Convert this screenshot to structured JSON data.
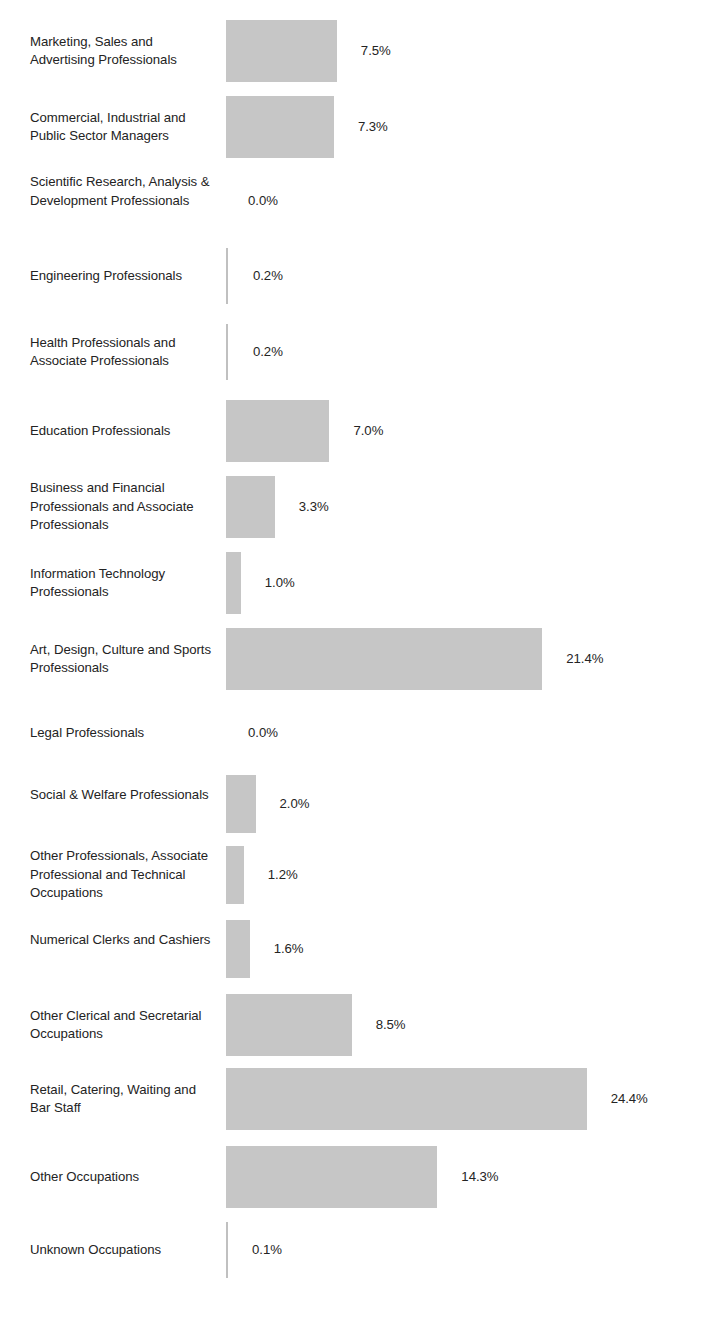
{
  "chart_data": {
    "type": "bar",
    "orientation": "horizontal",
    "title": "",
    "subtitle": "",
    "xlabel": "",
    "ylabel": "",
    "grid": false,
    "legend": "none",
    "axis_visible": false,
    "value_suffix": "%",
    "xlim": [
      0,
      24.4
    ],
    "categories": [
      "Marketing, Sales and Advertising Professionals",
      "Commercial, Industrial and Public Sector Managers",
      "Scientific Research, Analysis & Development Professionals",
      "Engineering Professionals",
      "Health Professionals and Associate Professionals",
      "Education Professionals",
      "Business and Financial Professionals and Associate Professionals",
      "Information Technology Professionals",
      "Art, Design, Culture and Sports Professionals",
      "Legal Professionals",
      "Social & Welfare Professionals",
      "Other Professionals, Associate Professional and Technical Occupations",
      "Numerical Clerks and Cashiers",
      "Other Clerical and Secretarial Occupations",
      "Retail, Catering, Waiting and Bar Staff",
      "Other Occupations",
      "Unknown Occupations"
    ],
    "values": [
      7.5,
      7.3,
      0.0,
      0.2,
      0.2,
      7.0,
      3.3,
      1.0,
      21.4,
      0.0,
      2.0,
      1.2,
      1.6,
      8.5,
      24.4,
      14.3,
      0.1
    ],
    "value_labels": [
      "7.5%",
      "7.3%",
      "0.0%",
      "0.2%",
      "0.2%",
      "7.0%",
      "3.3%",
      "1.0%",
      "21.4%",
      "0.0%",
      "2.0%",
      "1.2%",
      "1.6%",
      "8.5%",
      "24.4%",
      "14.3%",
      "0.1%"
    ],
    "bar_color": "#c6c6c6",
    "text_color": "#232323",
    "background_color": "#ffffff"
  },
  "rows": [
    {
      "label": "Marketing, Sales and Advertising Professionals",
      "value": "7.5%",
      "num": 7.5,
      "lines": 2
    },
    {
      "label": "Commercial, Industrial and Public Sector Managers",
      "value": "7.3%",
      "num": 7.3,
      "lines": 2
    },
    {
      "label": "Scientific Research, Analysis & Development Professionals",
      "value": "0.0%",
      "num": 0.0,
      "lines": 3
    },
    {
      "label": "Engineering Professionals",
      "value": "0.2%",
      "num": 0.2,
      "lines": 1
    },
    {
      "label": "Health Professionals and Associate Professionals",
      "value": "0.2%",
      "num": 0.2,
      "lines": 2
    },
    {
      "label": "Education Professionals",
      "value": "7.0%",
      "num": 7.0,
      "lines": 1
    },
    {
      "label": "Business and Financial Professionals and Associate Professionals",
      "value": "3.3%",
      "num": 3.3,
      "lines": 3
    },
    {
      "label": "Information Technology Professionals",
      "value": "1.0%",
      "num": 1.0,
      "lines": 2
    },
    {
      "label": "Art, Design, Culture and Sports Professionals",
      "value": "21.4%",
      "num": 21.4,
      "lines": 2
    },
    {
      "label": "Legal Professionals",
      "value": "0.0%",
      "num": 0.0,
      "lines": 1
    },
    {
      "label": "Social & Welfare Professionals",
      "value": "2.0%",
      "num": 2.0,
      "lines": 2
    },
    {
      "label": "Other Professionals, Associate Professional and Technical Occupations",
      "value": "1.2%",
      "num": 1.2,
      "lines": 3
    },
    {
      "label": "Numerical Clerks and Cashiers",
      "value": "1.6%",
      "num": 1.6,
      "lines": 2
    },
    {
      "label": "Other Clerical and Secretarial Occupations",
      "value": "8.5%",
      "num": 8.5,
      "lines": 2
    },
    {
      "label": "Retail, Catering, Waiting and Bar Staff",
      "value": "24.4%",
      "num": 24.4,
      "lines": 2
    },
    {
      "label": "Other Occupations",
      "value": "14.3%",
      "num": 14.3,
      "lines": 1
    },
    {
      "label": "Unknown Occupations",
      "value": "0.1%",
      "num": 0.1,
      "lines": 1
    }
  ],
  "layout": {
    "bar_origin_x": 226,
    "px_per_percent": 14.78,
    "row_pitch": 74.5,
    "bar_height": 62,
    "top_offset": 20,
    "value_gap": 24
  }
}
